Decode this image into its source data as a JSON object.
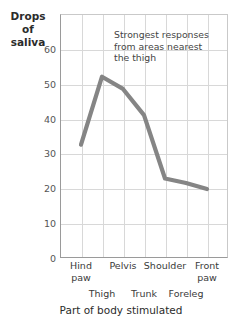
{
  "chart_data": {
    "type": "line",
    "title": "",
    "xlabel": "Part of body stimulated",
    "ylabel": "Drops of saliva",
    "ylabel_lines": [
      "Drops",
      "of",
      "saliva"
    ],
    "ylim": [
      0,
      70
    ],
    "yticks": [
      0,
      10,
      20,
      30,
      40,
      50,
      60
    ],
    "ytick_labels": [
      "0",
      "10",
      "20",
      "30",
      "40",
      "50",
      "60"
    ],
    "grid": true,
    "legend": "none",
    "categories": [
      "Hind paw",
      "Thigh",
      "Pelvis",
      "Trunk",
      "Shoulder",
      "Foreleg",
      "Front paw"
    ],
    "x": [
      1,
      2,
      3,
      4,
      5,
      6,
      7
    ],
    "values": [
      32.5,
      52,
      48.5,
      41,
      22.8,
      21.5,
      19.8
    ],
    "series": [
      {
        "name": "Drops of saliva",
        "color": "#858585",
        "values": [
          32.5,
          52,
          48.5,
          41,
          22.8,
          21.5,
          19.8
        ]
      }
    ],
    "annotations": [
      {
        "text": "Strongest responses from areas nearest the thigh",
        "lines": [
          "Strongest responses",
          "from areas nearest",
          "the thigh"
        ]
      }
    ]
  },
  "axes": {
    "y_title_lines": [
      "Drops",
      "of",
      "saliva"
    ],
    "x_title": "Part of body stimulated",
    "y_ticks": [
      {
        "label": "60",
        "value": 60
      },
      {
        "label": "50",
        "value": 50
      },
      {
        "label": "40",
        "value": 40
      },
      {
        "label": "30",
        "value": 30
      },
      {
        "label": "20",
        "value": 20
      },
      {
        "label": "10",
        "value": 10
      },
      {
        "label": "0",
        "value": 0
      }
    ],
    "x_labels_top": [
      {
        "label_lines": [
          "Hind",
          "paw"
        ],
        "x": 1
      },
      {
        "label_lines": [
          "Pelvis"
        ],
        "x": 3
      },
      {
        "label_lines": [
          "Shoulder"
        ],
        "x": 5
      },
      {
        "label_lines": [
          "Front",
          "paw"
        ],
        "x": 7
      }
    ],
    "x_labels_bottom": [
      {
        "label_lines": [
          "Thigh"
        ],
        "x": 2
      },
      {
        "label_lines": [
          "Trunk"
        ],
        "x": 4
      },
      {
        "label_lines": [
          "Foreleg"
        ],
        "x": 6
      }
    ]
  },
  "annotation": {
    "line1": "Strongest responses",
    "line2": "from areas nearest",
    "line3": "the thigh"
  },
  "ylabel": {
    "line1": "Drops",
    "line2": "of",
    "line3": "saliva"
  },
  "xtitle": "Part of body stimulated",
  "colors": {
    "line": "#858585",
    "grid": "#d8d8d8",
    "axis": "#9a9a9a",
    "text": "#3a3a3a"
  }
}
